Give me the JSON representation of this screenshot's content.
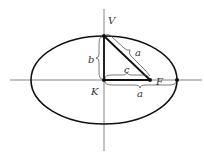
{
  "diagram": {
    "type": "ellipse-geometry",
    "labels": {
      "vertex_top": "V",
      "focus": "F",
      "center": "K",
      "semi_major_hyp": "a",
      "semi_major_axis": "a",
      "semi_minor": "b",
      "focal_distance": "c"
    },
    "colors": {
      "stroke": "#111111",
      "axis": "#555555",
      "text": "#333333"
    }
  }
}
